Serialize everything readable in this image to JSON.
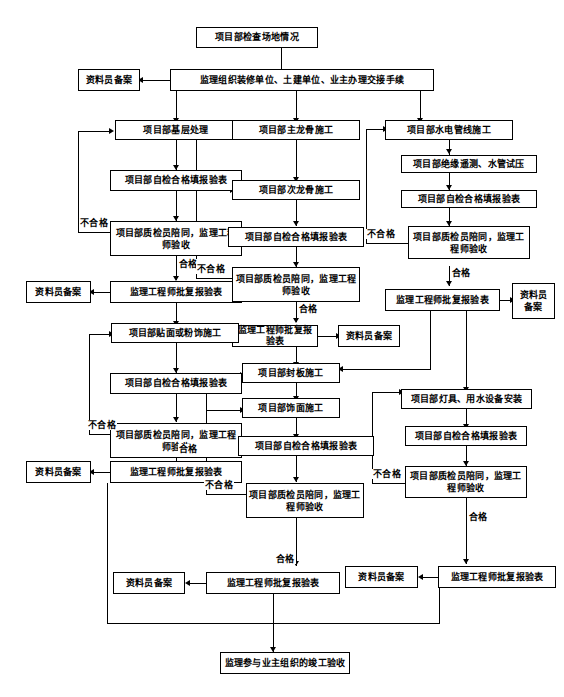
{
  "diagram": {
    "type": "flowchart",
    "nodes": {
      "start": "项目部检查场地情况",
      "handover": "监理组织装修单位、土建单位、业主办理交接手续",
      "archive_top": "资料员备案",
      "base_treat": "项目部基层处理",
      "base_self_check": "项目部自检合格填报验表",
      "base_inspect": "项目部质检员陪同，监理工程师验收",
      "base_approve": "监理工程师批复报验表",
      "base_archive": "资料员备案",
      "main_keel": "项目部主龙骨施工",
      "sub_keel": "项目部次龙骨施工",
      "keel_self_check": "项目部自检合格填报验表",
      "keel_inspect": "项目部质检员陪同，监理工程师验收",
      "keel_approve": "监理工程师批复报验表",
      "keel_archive": "资料员备案",
      "pipe_build": "项目部水电管线施工",
      "pipe_test": "项目部绝缘遥测、水管试压",
      "pipe_self_check": "项目部自检合格填报验表",
      "pipe_inspect": "项目部质检员陪同，监理工程师验收",
      "pipe_approve": "监理工程师批复报验表",
      "pipe_archive": "资料员备案",
      "surface_build": "项目部贴面或粉饰施工",
      "surface_self_check": "项目部自检合格填报验表",
      "surface_inspect": "项目部质检员陪同，监理工程师验收",
      "surface_approve": "监理工程师批复报验表",
      "surface_archive": "资料员备案",
      "board_build": "项目部封板施工",
      "decor_build": "项目部饰面施工",
      "decor_self_check": "项目部自检合格填报验表",
      "decor_inspect": "项目部质检员陪同，监理工程师验收",
      "decor_approve": "监理工程师批复报验表",
      "decor_archive": "资料员备案",
      "lamp_install": "项目部灯具、用水设备安装",
      "lamp_self_check": "项目部自检合格填报验表",
      "lamp_inspect": "项目部质检员陪同，监理工程师验收",
      "lamp_approve": "监理工程师批复报验表",
      "lamp_archive": "资料员备案",
      "final": "监理参与业主组织的竣工验收"
    },
    "edge_labels": {
      "fail_base": "不合格",
      "pass_base": "合格",
      "fail_keel": "不合格",
      "pass_keel": "合格",
      "fail_pipe": "不合格",
      "pass_pipe": "合格",
      "fail_surface": "不合格",
      "pass_surface": "合格",
      "fail_decor": "不合格",
      "pass_decor": "合格",
      "fail_lamp": "不合格",
      "pass_lamp": "合格"
    },
    "colors": {
      "line": "#000000",
      "box_fill": "#ffffff",
      "text": "#000000",
      "background": "#ffffff"
    }
  }
}
